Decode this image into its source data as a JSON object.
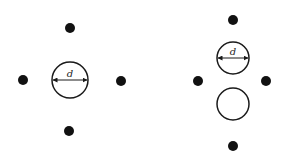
{
  "diagram": {
    "colors": {
      "stroke": "#1a1a1a",
      "dot": "#111111",
      "background": "#ffffff"
    },
    "left_figure": {
      "dots": [
        {
          "name": "top",
          "cx": 70,
          "cy": 28
        },
        {
          "name": "left",
          "cx": 23,
          "cy": 80
        },
        {
          "name": "right",
          "cx": 121,
          "cy": 81
        },
        {
          "name": "bottom",
          "cx": 69,
          "cy": 131
        }
      ],
      "circle": {
        "cx": 70,
        "cy": 80,
        "r": 18
      },
      "dimension_label": "d"
    },
    "right_figure": {
      "dots": [
        {
          "name": "top",
          "cx": 233,
          "cy": 20
        },
        {
          "name": "left",
          "cx": 198,
          "cy": 81
        },
        {
          "name": "right",
          "cx": 266,
          "cy": 81
        },
        {
          "name": "bottom",
          "cx": 233,
          "cy": 146
        }
      ],
      "upper_circle": {
        "cx": 233,
        "cy": 58,
        "r": 16
      },
      "lower_circle": {
        "cx": 233,
        "cy": 104,
        "r": 16
      },
      "dimension_label": "d"
    }
  }
}
